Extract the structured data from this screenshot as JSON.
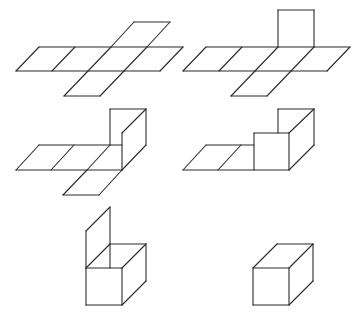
{
  "diagram": {
    "stroke_color": "#2a2a2a",
    "background": "#ffffff",
    "figures": [
      {
        "id": "step-1",
        "description": "Flat cross-shaped net of six squares",
        "segments": [
          [
            16,
            71,
            160,
            71
          ],
          [
            39,
            47,
            183,
            47
          ],
          [
            16,
            71,
            39,
            47
          ],
          [
            52,
            71,
            75,
            47
          ],
          [
            88,
            71,
            111,
            47
          ],
          [
            124,
            71,
            147,
            47
          ],
          [
            160,
            71,
            183,
            47
          ],
          [
            111,
            47,
            134,
            22
          ],
          [
            147,
            47,
            170,
            22
          ],
          [
            134,
            22,
            170,
            22
          ],
          [
            88,
            71,
            64,
            96
          ],
          [
            124,
            71,
            100,
            96
          ],
          [
            64,
            96,
            100,
            96
          ]
        ]
      },
      {
        "id": "step-2",
        "description": "Net with one face folded up",
        "segments": [
          [
            183,
            71,
            327,
            71
          ],
          [
            206,
            47,
            350,
            47
          ],
          [
            183,
            71,
            206,
            47
          ],
          [
            219,
            71,
            242,
            47
          ],
          [
            255,
            71,
            278,
            47
          ],
          [
            291,
            71,
            314,
            47
          ],
          [
            327,
            71,
            350,
            47
          ],
          [
            278,
            47,
            278,
            10
          ],
          [
            314,
            47,
            314,
            10
          ],
          [
            278,
            10,
            314,
            10
          ],
          [
            255,
            71,
            231,
            96
          ],
          [
            291,
            71,
            267,
            96
          ],
          [
            231,
            96,
            267,
            96
          ]
        ]
      },
      {
        "id": "step-3",
        "description": "Net with two faces folded up",
        "segments": [
          [
            16,
            170,
            122,
            170
          ],
          [
            39,
            145,
            122,
            145
          ],
          [
            16,
            170,
            39,
            145
          ],
          [
            51,
            170,
            74,
            145
          ],
          [
            87,
            170,
            110,
            145
          ],
          [
            110,
            145,
            110,
            109
          ],
          [
            110,
            109,
            146,
            109
          ],
          [
            146,
            109,
            146,
            145
          ],
          [
            146,
            145,
            122,
            170
          ],
          [
            122,
            170,
            122,
            133
          ],
          [
            122,
            133,
            146,
            109
          ],
          [
            87,
            170,
            63,
            195
          ],
          [
            122,
            170,
            99,
            195
          ],
          [
            63,
            195,
            99,
            195
          ]
        ]
      },
      {
        "id": "step-4",
        "description": "Net with three faces folded up",
        "segments": [
          [
            183,
            170,
            289,
            170
          ],
          [
            206,
            145,
            254,
            145
          ],
          [
            183,
            170,
            206,
            145
          ],
          [
            218,
            170,
            241,
            145
          ],
          [
            254,
            170,
            254,
            133
          ],
          [
            254,
            133,
            289,
            133
          ],
          [
            289,
            133,
            289,
            170
          ],
          [
            278,
            133,
            278,
            109
          ],
          [
            278,
            109,
            314,
            109
          ],
          [
            314,
            109,
            314,
            145
          ],
          [
            314,
            145,
            289,
            170
          ],
          [
            289,
            133,
            314,
            109
          ]
        ]
      },
      {
        "id": "step-5",
        "description": "Open box with lid flap raised",
        "segments": [
          [
            86,
            268,
            122,
            268
          ],
          [
            122,
            268,
            122,
            305
          ],
          [
            122,
            305,
            86,
            305
          ],
          [
            86,
            305,
            86,
            268
          ],
          [
            122,
            268,
            146,
            244
          ],
          [
            146,
            244,
            146,
            281
          ],
          [
            146,
            281,
            122,
            305
          ],
          [
            110,
            244,
            146,
            244
          ],
          [
            86,
            268,
            110,
            244
          ],
          [
            86,
            268,
            86,
            231
          ],
          [
            86,
            231,
            110,
            207
          ],
          [
            110,
            207,
            110,
            268
          ]
        ]
      },
      {
        "id": "step-6",
        "description": "Closed cube",
        "segments": [
          [
            253,
            268,
            289,
            268
          ],
          [
            289,
            268,
            289,
            305
          ],
          [
            289,
            305,
            253,
            305
          ],
          [
            253,
            305,
            253,
            268
          ],
          [
            289,
            268,
            313,
            244
          ],
          [
            313,
            244,
            313,
            281
          ],
          [
            313,
            281,
            289,
            305
          ],
          [
            253,
            268,
            277,
            244
          ],
          [
            277,
            244,
            313,
            244
          ]
        ]
      }
    ]
  }
}
